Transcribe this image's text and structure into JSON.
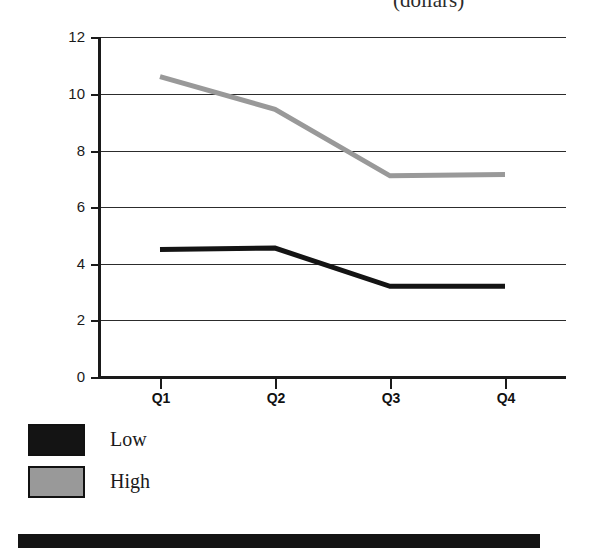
{
  "title": {
    "text": "(dollars)"
  },
  "legend": {
    "items": [
      {
        "label": "Low",
        "color": "#141414",
        "swatch": "legend-swatch-low"
      },
      {
        "label": "High",
        "color": "#999999",
        "swatch": "legend-swatch-high"
      }
    ]
  },
  "axes": {
    "y_ticks": [
      "12",
      "10",
      "8",
      "6",
      "4",
      "2",
      "0"
    ],
    "x_ticks": [
      "Q1",
      "Q2",
      "Q3",
      "Q4"
    ]
  },
  "chart_data": {
    "type": "line",
    "title": "(dollars)",
    "xlabel": "",
    "ylabel": "",
    "categories": [
      "Q1",
      "Q2",
      "Q3",
      "Q4"
    ],
    "series": [
      {
        "name": "Low",
        "color": "#141414",
        "values": [
          4.5,
          4.55,
          3.2,
          3.2
        ]
      },
      {
        "name": "High",
        "color": "#999999",
        "values": [
          10.6,
          9.45,
          7.1,
          7.15
        ]
      }
    ],
    "ylim": [
      0,
      12
    ],
    "yticks": [
      0,
      2,
      4,
      6,
      8,
      10,
      12
    ],
    "grid": true,
    "legend_position": "below-left"
  }
}
